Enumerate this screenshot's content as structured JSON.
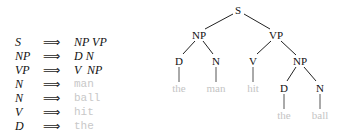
{
  "grammar": {
    "arrow": "⟹",
    "rules": [
      {
        "lhs": "S",
        "rhs": "NP VP",
        "terminal": false
      },
      {
        "lhs": "NP",
        "rhs": "D N",
        "terminal": false
      },
      {
        "lhs": "VP",
        "rhs": "V  NP",
        "terminal": false
      },
      {
        "lhs": "N",
        "rhs": "man",
        "terminal": true
      },
      {
        "lhs": "N",
        "rhs": "ball",
        "terminal": true
      },
      {
        "lhs": "V",
        "rhs": "hit",
        "terminal": true
      },
      {
        "lhs": "D",
        "rhs": "the",
        "terminal": true
      }
    ]
  },
  "tree": {
    "nodes": {
      "S": "S",
      "NP1": "NP",
      "VP": "VP",
      "D1": "D",
      "N1": "N",
      "V": "V",
      "NP2": "NP",
      "D2": "D",
      "N2": "N"
    },
    "leaves": {
      "the1": "the",
      "man": "man",
      "hit": "hit",
      "the2": "the",
      "ball": "ball"
    }
  }
}
